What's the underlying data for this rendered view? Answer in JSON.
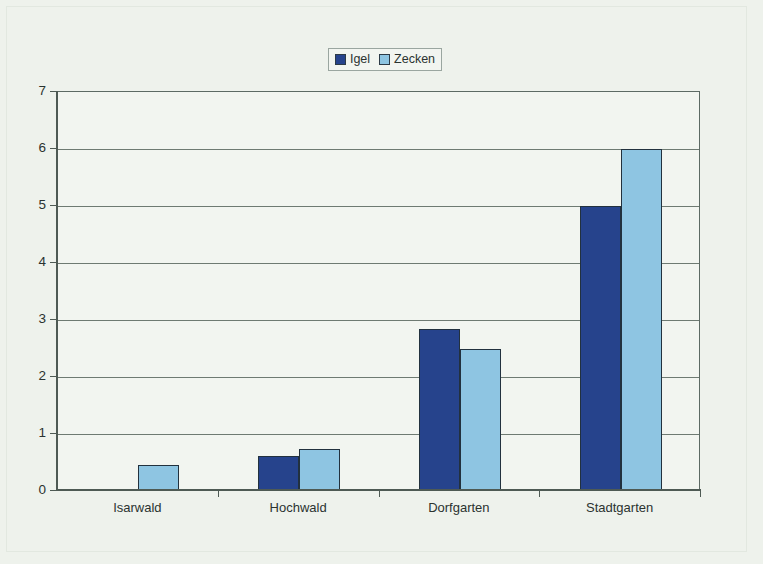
{
  "chart_data": {
    "type": "bar",
    "title": "",
    "subtitle": "",
    "xlabel": "",
    "ylabel": "",
    "categories": [
      "Isarwald",
      "Hochwald",
      "Dorfgarten",
      "Stadtgarten"
    ],
    "series": [
      {
        "name": "Igel",
        "color": "#26438c",
        "values": [
          0,
          0.62,
          2.85,
          5.0
        ]
      },
      {
        "name": "Zecken",
        "color": "#8ec5e2",
        "values": [
          0.45,
          0.73,
          2.5,
          6.0
        ]
      }
    ],
    "ylim": [
      0,
      7
    ],
    "yticks": [
      0,
      1,
      2,
      3,
      4,
      5,
      6,
      7
    ],
    "ytick_labels": [
      "0",
      "1",
      "2",
      "3",
      "4",
      "5",
      "6",
      "7"
    ],
    "grid": true,
    "legend_position": "top-center",
    "legend_entries": [
      "Igel",
      "Zecken"
    ],
    "annotations": []
  },
  "legend": {
    "items": [
      {
        "label": "Igel",
        "color": "#26438c"
      },
      {
        "label": "Zecken",
        "color": "#8ec5e2"
      }
    ]
  },
  "axes": {
    "y_tick_labels": [
      "7",
      "6",
      "5",
      "4",
      "3",
      "2",
      "1",
      "0"
    ],
    "x_tick_labels": [
      "Isarwald",
      "Hochwald",
      "Dorfgarten",
      "Stadtgarten"
    ]
  },
  "colors": {
    "igel": "#26438c",
    "zecken": "#8ec5e2",
    "background": "#eef2ec",
    "plot_background": "#f2f5f0",
    "grid": "#6e7a72",
    "axis": "#4e5a54"
  }
}
